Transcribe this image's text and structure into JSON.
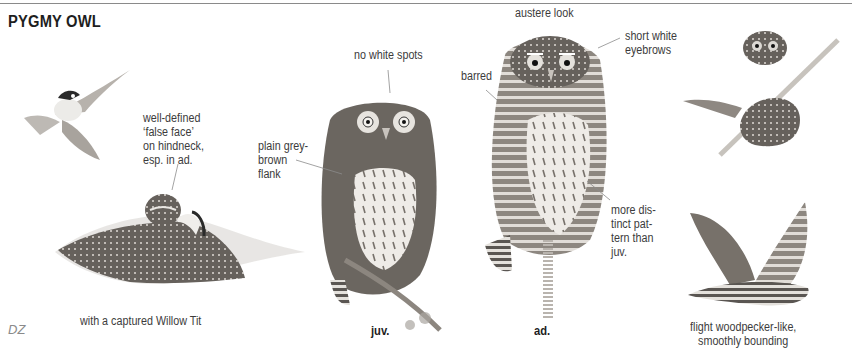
{
  "page": {
    "title": "PYGMY OWL",
    "credit": "DZ"
  },
  "illustrations": [
    {
      "id": "willow-tit-flying",
      "subject": "Willow Tit in flight"
    },
    {
      "id": "owl-with-prey",
      "subject": "Pygmy Owl mantling captured Willow Tit",
      "caption": "with a captured Willow Tit"
    },
    {
      "id": "owl-juvenile",
      "subject": "Juvenile Pygmy Owl perched",
      "caption": "juv."
    },
    {
      "id": "owl-adult",
      "subject": "Adult Pygmy Owl perched",
      "caption": "ad."
    },
    {
      "id": "owl-perched-branch",
      "subject": "Pygmy Owl on diagonal branch"
    },
    {
      "id": "owl-flight",
      "subject": "Pygmy Owl in flight",
      "caption": "flight woodpecker-like,\nsmoothly bounding"
    }
  ],
  "annotations": {
    "false_face": "well-defined\n‘false face’\non hindneck,\nesp. in ad.",
    "plain_flank": "plain grey-\nbrown\nflank",
    "no_white_spots": "no white spots",
    "austere_look": "austere look",
    "short_eyebrows": "short white\neyebrows",
    "barred": "barred",
    "more_distinct": "more dis-\ntinct pat-\ntern than\njuv."
  },
  "captions": {
    "prey": "with a captured Willow Tit",
    "juv": "juv.",
    "ad": "ad.",
    "flight": "flight woodpecker-like,\nsmoothly bounding"
  },
  "colors": {
    "text": "#3c3c3c",
    "title": "#1e1e1e",
    "rule": "#8a8a8a",
    "plumage_dark": "#5e5a56",
    "plumage_mid": "#8a8580",
    "plumage_light": "#d9d6d2"
  }
}
